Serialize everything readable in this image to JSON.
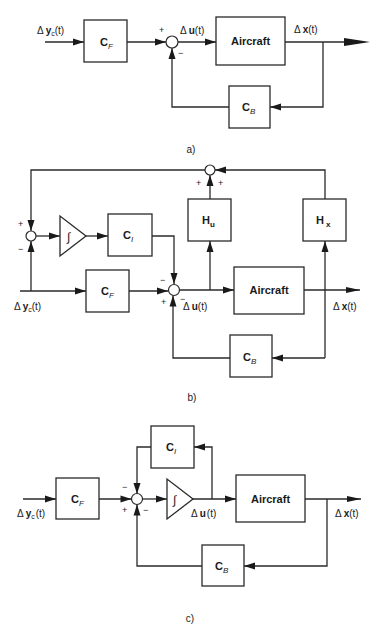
{
  "diagrams": [
    {
      "caption": "a)",
      "signals": {
        "input": "Δyᴄ(t)",
        "input_delta": "Δ",
        "input_var": "y",
        "input_sub": "c",
        "input_arg": "(t)",
        "control_delta": "Δ",
        "control_var": "u",
        "control_arg": "(t)",
        "state_delta": "Δ",
        "state_var": "x",
        "state_arg": "(t)"
      },
      "blocks": {
        "feedforward": {
          "main": "C",
          "sub": "F"
        },
        "plant": {
          "label": "Aircraft"
        },
        "feedback": {
          "main": "C",
          "sub": "B"
        }
      },
      "signs": {
        "sum_top_left": "+",
        "sum_bottom": "−"
      }
    },
    {
      "caption": "b)",
      "signals": {
        "input_delta": "Δ",
        "input_var": "y",
        "input_sub": "c",
        "input_arg": "(t)",
        "control_delta": "Δ",
        "control_var": "u",
        "control_arg": "(t)",
        "state_delta": "Δ",
        "state_var": "x",
        "state_arg": "(t)"
      },
      "blocks": {
        "integrator": {
          "symbol": "∫"
        },
        "integral_gain": {
          "main": "C",
          "sub": "I"
        },
        "feedforward": {
          "main": "C",
          "sub": "F"
        },
        "plant": {
          "label": "Aircraft"
        },
        "feedback": {
          "main": "C",
          "sub": "B"
        },
        "output_u": {
          "main": "H",
          "sub": "u"
        },
        "output_x": {
          "main": "H",
          "sub": "x"
        }
      },
      "signs": {
        "left_sum_top": "+",
        "left_sum_bottom": "−",
        "top_sum_left": "+",
        "top_sum_right": "+",
        "main_sum_top": "−",
        "main_sum_left": "+",
        "main_sum_right": "−"
      }
    },
    {
      "caption": "c)",
      "signals": {
        "input_delta": "Δ",
        "input_var": "y",
        "input_sub": "c",
        "input_arg": "(t)",
        "control_delta": "Δ",
        "control_var": "u",
        "control_arg": "(t)",
        "state_delta": "Δ",
        "state_var": "x",
        "state_arg": "(t)"
      },
      "blocks": {
        "integral_gain": {
          "main": "C",
          "sub": "I"
        },
        "feedforward": {
          "main": "C",
          "sub": "F"
        },
        "integrator": {
          "symbol": "∫"
        },
        "plant": {
          "label": "Aircraft"
        },
        "feedback": {
          "main": "C",
          "sub": "B"
        }
      },
      "signs": {
        "sum_top": "−",
        "sum_left": "+",
        "sum_right": "−"
      }
    }
  ]
}
